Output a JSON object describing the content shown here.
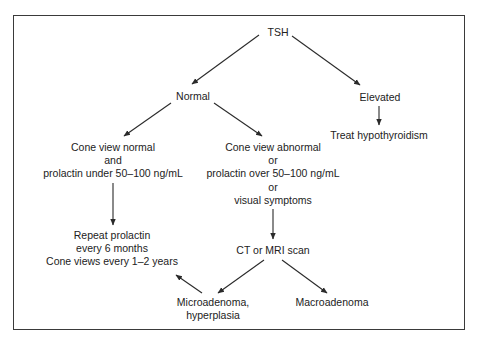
{
  "diagram": {
    "type": "flowchart",
    "title": "",
    "nodes": {
      "tsh": {
        "lines": [
          "TSH"
        ]
      },
      "normal": {
        "lines": [
          "Normal"
        ]
      },
      "elevated": {
        "lines": [
          "Elevated"
        ]
      },
      "treat": {
        "lines": [
          "Treat hypothyroidism"
        ]
      },
      "cone_normal": {
        "lines": [
          "Cone view normal",
          "and",
          "prolactin under 50–100 ng/mL"
        ]
      },
      "cone_abnormal": {
        "lines": [
          "Cone view abnormal",
          "or",
          "prolactin over 50–100 ng/mL",
          "or",
          "visual symptoms"
        ]
      },
      "repeat": {
        "lines": [
          "Repeat prolactin",
          "every 6 months",
          "Cone views every 1–2 years"
        ]
      },
      "ct_mri": {
        "lines": [
          "CT or MRI scan"
        ]
      },
      "micro": {
        "lines": [
          "Microadenoma,",
          "hyperplasia"
        ]
      },
      "macro": {
        "lines": [
          "Macroadenoma"
        ]
      }
    },
    "edges": [
      {
        "from": "tsh",
        "to": "normal"
      },
      {
        "from": "tsh",
        "to": "elevated"
      },
      {
        "from": "elevated",
        "to": "treat"
      },
      {
        "from": "normal",
        "to": "cone_normal"
      },
      {
        "from": "normal",
        "to": "cone_abnormal"
      },
      {
        "from": "cone_normal",
        "to": "repeat"
      },
      {
        "from": "cone_abnormal",
        "to": "ct_mri"
      },
      {
        "from": "ct_mri",
        "to": "micro"
      },
      {
        "from": "ct_mri",
        "to": "macro"
      },
      {
        "from": "micro",
        "to": "repeat"
      }
    ],
    "colors": {
      "line": "#2a2a2a",
      "text": "#222222",
      "frame": "#3a3a3a",
      "background": "#ffffff"
    }
  }
}
